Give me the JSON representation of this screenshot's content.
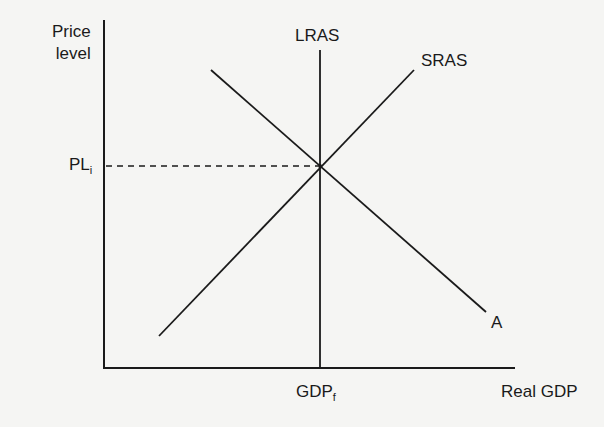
{
  "diagram": {
    "type": "AD-AS model",
    "y_axis_label_line1": "Price",
    "y_axis_label_line2": "level",
    "x_axis_label": "Real GDP",
    "curves": {
      "lras": "LRAS",
      "sras": "SRAS",
      "ad": "A"
    },
    "price_marker": {
      "base": "PL",
      "sub": "i"
    },
    "gdp_marker": {
      "base": "GDP",
      "sub": "f"
    },
    "colors": {
      "line": "#1a1a1a",
      "background": "#f5f5f3"
    }
  }
}
